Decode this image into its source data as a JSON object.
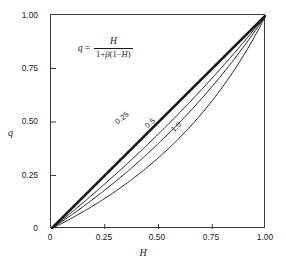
{
  "figure": {
    "equation": {
      "lhs": "q",
      "equals": "=",
      "numerator": "H",
      "denominator_prefix": "1+",
      "denominator_beta": "β",
      "denominator_suffix_open": "(1−",
      "denominator_var": "H",
      "denominator_suffix_close": ")",
      "plain": "q = H / (1 + β(1−H))"
    },
    "caption": "",
    "line_color": "#1a1a1a"
  },
  "chart_data": {
    "type": "line",
    "title": "",
    "xlabel": "H",
    "ylabel": "q",
    "xlim": [
      0,
      1
    ],
    "ylim": [
      0,
      1
    ],
    "grid": false,
    "legend": "inline-curve-labels",
    "xticks": [
      "0",
      "0.25",
      "0.50",
      "0.75",
      "1.00"
    ],
    "xtick_values": [
      0,
      0.25,
      0.5,
      0.75,
      1.0
    ],
    "yticks": [
      "0",
      "0.25",
      "0.50",
      "0.75",
      "1.00"
    ],
    "ytick_values": [
      0,
      0.25,
      0.5,
      0.75,
      1.0
    ],
    "x": [
      0,
      0.05,
      0.1,
      0.15,
      0.2,
      0.25,
      0.3,
      0.35,
      0.4,
      0.45,
      0.5,
      0.55,
      0.6,
      0.65,
      0.7,
      0.75,
      0.8,
      0.85,
      0.9,
      0.95,
      1.0
    ],
    "series": [
      {
        "name": "0",
        "label": "",
        "beta": 0,
        "linewidth": 2.6,
        "values": [
          0,
          0.05,
          0.1,
          0.15,
          0.2,
          0.25,
          0.3,
          0.35,
          0.4,
          0.45,
          0.5,
          0.55,
          0.6,
          0.65,
          0.7,
          0.75,
          0.8,
          0.85,
          0.9,
          0.95,
          1.0
        ]
      },
      {
        "name": "0.25",
        "label": "0.25",
        "beta": 0.25,
        "linewidth": 1.0,
        "values": [
          0,
          0.0417,
          0.0842,
          0.1274,
          0.1714,
          0.2162,
          0.2619,
          0.3084,
          0.3559,
          0.4043,
          0.4536,
          0.504,
          0.5553,
          0.6078,
          0.6614,
          0.7161,
          0.772,
          0.8291,
          0.8876,
          0.9473,
          1.0
        ]
      },
      {
        "name": "0.5",
        "label": "0.5",
        "beta": 0.5,
        "linewidth": 1.0,
        "values": [
          0,
          0.0351,
          0.0714,
          0.1091,
          0.1481,
          0.1887,
          0.2308,
          0.2745,
          0.32,
          0.3673,
          0.4167,
          0.4681,
          0.5217,
          0.5778,
          0.6364,
          0.6977,
          0.7619,
          0.8293,
          0.9,
          0.9744,
          1.0
        ]
      },
      {
        "name": "1.0",
        "label": "1.0",
        "beta": 1.0,
        "linewidth": 1.0,
        "values": [
          0,
          0.0263,
          0.0556,
          0.0882,
          0.125,
          0.1667,
          0.2143,
          0.2692,
          0.3333,
          0.4091,
          0.5,
          0.6111,
          0.75,
          0.9286,
          1.0,
          1.0,
          1.0,
          1.0,
          1.0,
          1.0,
          1.0
        ]
      }
    ],
    "curve_labels": [
      {
        "text": "0.25",
        "x_pct": 30.0,
        "y_pct": 48.0,
        "angle": -38
      },
      {
        "text": "0.5",
        "x_pct": 44.0,
        "y_pct": 50.0,
        "angle": -40
      },
      {
        "text": "1.0",
        "x_pct": 56.5,
        "y_pct": 52.0,
        "angle": -42
      }
    ]
  }
}
